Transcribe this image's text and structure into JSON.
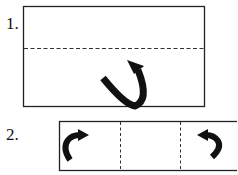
{
  "steps": [
    {
      "label": "1.",
      "fold": "horizontal-center",
      "arrow": "curved-up-arrow"
    },
    {
      "label": "2.",
      "fold": "vertical-thirds",
      "arrows": [
        "curved-left-to-right-arrow",
        "curved-right-to-left-arrow"
      ]
    }
  ],
  "colors": {
    "stroke": "#222222",
    "arrow": "#111111"
  }
}
